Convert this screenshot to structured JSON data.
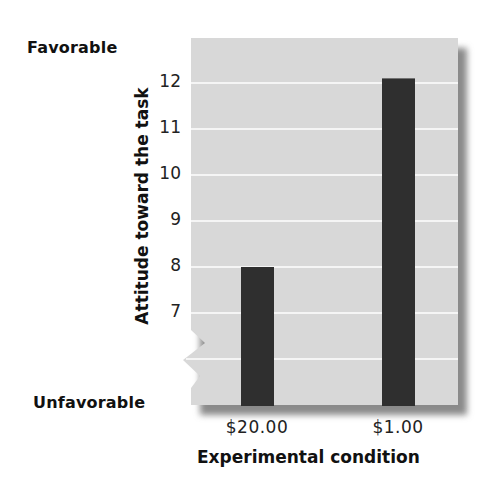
{
  "chart_data": {
    "type": "bar",
    "title": "",
    "categories": [
      "$20.00",
      "$1.00"
    ],
    "values": [
      8.0,
      12.1
    ],
    "xlabel": "Experimental condition",
    "ylabel": "Attitude toward the task",
    "yticks": [
      "12",
      "11",
      "10",
      "9",
      "8",
      "7"
    ],
    "ylim": [
      6,
      12.5
    ],
    "y_axis_break": true,
    "y_axis_end_labels": {
      "top": "Favorable",
      "bottom": "Unfavorable"
    },
    "grid": true,
    "legend": null,
    "colors": {
      "bar": "#2f2f2f",
      "plot_background": "#d6d6d6",
      "gridline": "#f4f4f4",
      "shadow": "#8a8a8a"
    }
  },
  "labels": {
    "favorable": "Favorable",
    "unfavorable": "Unfavorable",
    "ylabel": "Attitude toward the task",
    "xlabel": "Experimental condition",
    "yticks": [
      "12",
      "11",
      "10",
      "9",
      "8",
      "7"
    ],
    "xticks": [
      "$20.00",
      "$1.00"
    ]
  }
}
